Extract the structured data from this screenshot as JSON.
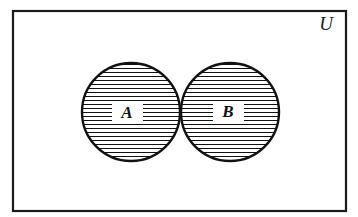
{
  "figure": {
    "kind": "venn-diagram",
    "width": 358,
    "height": 217,
    "background_color": "#ffffff",
    "ink_color": "#111111"
  },
  "universe": {
    "label": "U",
    "label_x": 326,
    "label_y": 30,
    "label_font_size": 19,
    "rect": {
      "x": 13,
      "y": 11,
      "width": 333,
      "height": 200
    },
    "border_color": "#1a1a1a",
    "border_width": 2.2,
    "fill_color": "#ffffff"
  },
  "sets": [
    {
      "name": "set-a",
      "label": "A",
      "cx": 131,
      "cy": 112,
      "r": 49,
      "label_x": 127,
      "label_y": 118,
      "label_font_size": 17,
      "shaded": true,
      "stroke_color": "#111111",
      "stroke_width": 2.4
    },
    {
      "name": "set-b",
      "label": "B",
      "cx": 230,
      "cy": 112,
      "r": 49,
      "label_x": 228,
      "label_y": 117,
      "label_font_size": 17,
      "shaded": true,
      "stroke_color": "#111111",
      "stroke_width": 2.4
    }
  ],
  "intersection": {
    "name": "a-intersect-b",
    "shaded": false,
    "fill_color": "#ffffff",
    "upper_point_x": 181,
    "upper_point_y": 72,
    "lower_point_x": 181,
    "lower_point_y": 152
  },
  "hatching": {
    "orientation": "horizontal",
    "spacing_px": 4,
    "line_width": 1,
    "line_color": "#111111",
    "first_line_y": 56,
    "last_line_y": 168
  },
  "label_gaps": [
    {
      "for": "A",
      "x": 112,
      "y": 103,
      "width": 31,
      "height": 19
    },
    {
      "for": "B",
      "x": 213,
      "y": 102,
      "width": 31,
      "height": 19
    }
  ],
  "chart_data": {
    "type": "venn",
    "universe_label": "U",
    "sets": [
      "A",
      "B"
    ],
    "regions": [
      {
        "region": "A only",
        "shaded": true
      },
      {
        "region": "B only",
        "shaded": true
      },
      {
        "region": "A and B",
        "shaded": false
      },
      {
        "region": "outside A and B",
        "shaded": false
      }
    ],
    "shaded_meaning": "symmetric difference (A union B) minus (A intersect B)",
    "legend": []
  }
}
